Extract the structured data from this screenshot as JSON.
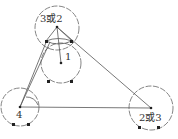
{
  "diagram": {
    "type": "network-of-circles",
    "nodes": [
      {
        "id": "top",
        "label": "3或2",
        "cx": 57,
        "cy": 28,
        "r": 22,
        "label_x": 40,
        "label_y": 22
      },
      {
        "id": "mid",
        "label": "1",
        "cx": 61,
        "cy": 63,
        "r": 20,
        "label_x": 65,
        "label_y": 60
      },
      {
        "id": "left",
        "label": "4",
        "cx": 20,
        "cy": 107,
        "r": 19,
        "label_x": 16,
        "label_y": 118
      },
      {
        "id": "right",
        "label": "2或3",
        "cx": 151,
        "cy": 108,
        "r": 22,
        "label_x": 139,
        "label_y": 121
      }
    ],
    "edges": [
      {
        "from": "top",
        "to": "mid"
      },
      {
        "from": "top",
        "to": "right"
      },
      {
        "from": "left",
        "to": "right"
      },
      {
        "from": "left",
        "to": "top"
      }
    ],
    "colors": {
      "line": "#555555",
      "dot": "#222222",
      "text": "#333333"
    }
  }
}
